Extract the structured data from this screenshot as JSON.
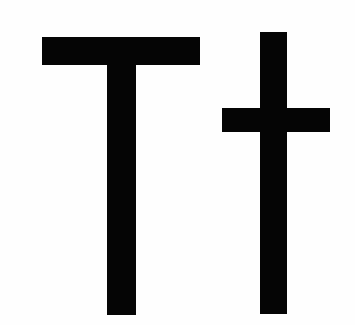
{
  "glyph": {
    "text": "Tt",
    "description": "Typography / text icon showing uppercase T and lowercase t",
    "colors": {
      "foreground": "#050505",
      "background": "#ffffff"
    }
  }
}
